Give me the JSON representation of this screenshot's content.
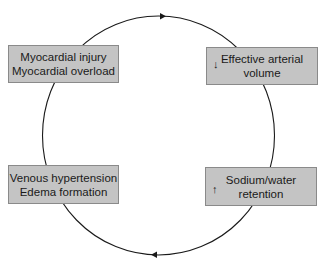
{
  "diagram": {
    "type": "cycle",
    "direction": "clockwise",
    "colors": {
      "box_fill": "#c4c4c4",
      "box_border": "#8a8a8a",
      "line": "#1a1a1a"
    },
    "nodes": [
      {
        "id": "tl",
        "line1": "Myocardial injury",
        "line2": "Myocardial overload",
        "indicator": ""
      },
      {
        "id": "tr",
        "line1": "Effective arterial",
        "line2": "volume",
        "indicator": "↓"
      },
      {
        "id": "br",
        "line1": "Sodium/water",
        "line2": "retention",
        "indicator": "↑"
      },
      {
        "id": "bl",
        "line1": "Venous hypertension",
        "line2": "Edema formation",
        "indicator": ""
      }
    ],
    "edges": [
      {
        "from": "tl",
        "to": "tr",
        "arrow": "top-right-pointing"
      },
      {
        "from": "tr",
        "to": "br"
      },
      {
        "from": "br",
        "to": "bl",
        "arrow": "bottom-left-pointing"
      },
      {
        "from": "bl",
        "to": "tl"
      }
    ]
  }
}
